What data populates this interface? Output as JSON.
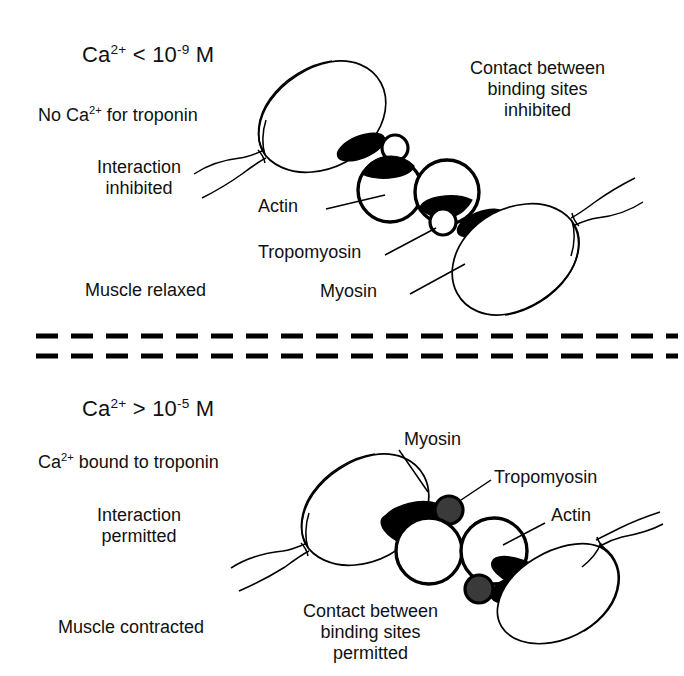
{
  "figure": {
    "background_color": "#ffffff",
    "ink_color": "#000000",
    "troponin_fill_relaxed": "#ffffff",
    "troponin_fill_contracted": "#3a3a3a",
    "tropomyosin_fill": "#000000"
  },
  "panels": [
    {
      "id": "relaxed",
      "heading": {
        "prefix": "Ca",
        "charge": "2+",
        "relation": " < 10",
        "exponent": "-9",
        "unit": " M",
        "plain": "Ca2+ < 10-9 M"
      },
      "left_labels": [
        {
          "id": "troponin-state",
          "plain": "No Ca2+ for troponin",
          "prefix": "No Ca",
          "charge": "2+",
          "suffix": " for troponin"
        },
        {
          "id": "interaction-state",
          "lines": [
            "Interaction",
            "inhibited"
          ]
        },
        {
          "id": "muscle-state",
          "lines": [
            "Muscle relaxed"
          ]
        }
      ],
      "right_label": {
        "id": "contact-state",
        "lines": [
          "Contact between",
          "binding sites",
          "inhibited"
        ]
      },
      "callouts": [
        {
          "id": "actin",
          "text": "Actin"
        },
        {
          "id": "tropomyosin",
          "text": "Tropomyosin"
        },
        {
          "id": "myosin",
          "text": "Myosin"
        }
      ]
    },
    {
      "id": "contracted",
      "heading": {
        "prefix": "Ca",
        "charge": "2+",
        "relation": " > 10",
        "exponent": "-5",
        "unit": " M",
        "plain": "Ca2+ > 10-5 M"
      },
      "left_labels": [
        {
          "id": "troponin-state",
          "plain": "Ca2+ bound to troponin",
          "prefix": "Ca",
          "charge": "2+",
          "suffix": " bound to troponin"
        },
        {
          "id": "interaction-state",
          "lines": [
            "Interaction",
            "permitted"
          ]
        },
        {
          "id": "muscle-state",
          "lines": [
            "Muscle contracted"
          ]
        }
      ],
      "bottom_label": {
        "id": "contact-state",
        "lines": [
          "Contact between",
          "binding sites",
          "permitted"
        ]
      },
      "callouts": [
        {
          "id": "myosin",
          "text": "Myosin"
        },
        {
          "id": "tropomyosin",
          "text": "Tropomyosin"
        },
        {
          "id": "actin",
          "text": "Actin"
        }
      ]
    }
  ],
  "divider": {
    "id": "panel-divider",
    "style": "double-dashed",
    "line_count": 2
  }
}
